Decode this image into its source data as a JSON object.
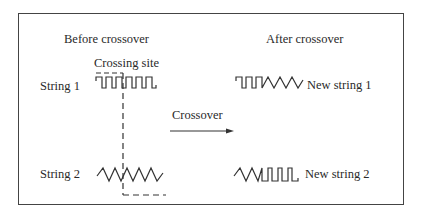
{
  "diagram": {
    "before_title": "Before crossover",
    "after_title": "After crossover",
    "crossing_site_label": "Crossing site",
    "string1_label": "String 1",
    "string2_label": "String 2",
    "arrow_label": "Crossover",
    "new_string1_label": "New string 1",
    "new_string2_label": "New string 2",
    "colors": {
      "line": "#333333",
      "border": "#444444",
      "text": "#2a2a2a"
    }
  }
}
